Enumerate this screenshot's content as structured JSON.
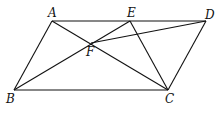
{
  "diagram": {
    "type": "geometry",
    "points": {
      "A": {
        "label": "A",
        "x": 52,
        "y": 21
      },
      "B": {
        "label": "B",
        "x": 14,
        "y": 90
      },
      "C": {
        "label": "C",
        "x": 168,
        "y": 90
      },
      "D": {
        "label": "D",
        "x": 206,
        "y": 21
      },
      "E": {
        "label": "E",
        "x": 130,
        "y": 21
      },
      "F": {
        "label": "F",
        "x": 91,
        "y": 43
      }
    },
    "segments": [
      [
        "A",
        "D"
      ],
      [
        "B",
        "C"
      ],
      [
        "A",
        "B"
      ],
      [
        "D",
        "C"
      ],
      [
        "A",
        "C"
      ],
      [
        "B",
        "E"
      ],
      [
        "E",
        "C"
      ],
      [
        "F",
        "D"
      ]
    ]
  }
}
